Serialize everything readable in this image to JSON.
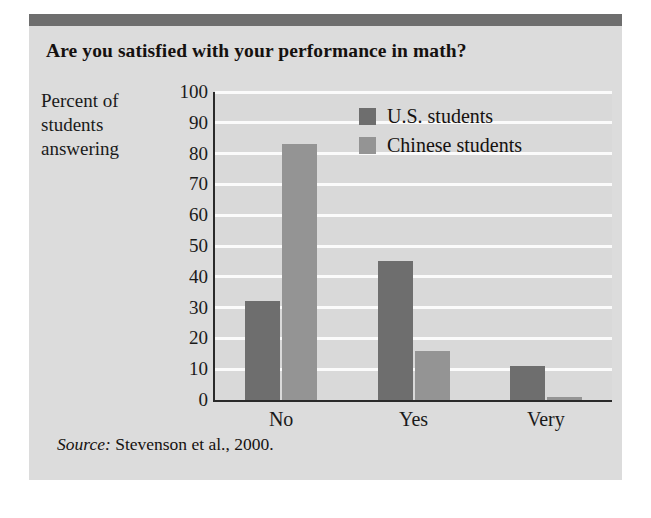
{
  "figure": {
    "title": "Are you satisfied with your performance in math?",
    "axis_caption_lines": [
      "Percent of",
      "students",
      "answering"
    ],
    "source_lead": "Source:",
    "source_text": " Stevenson et al., 2000.",
    "colors": {
      "panel_background": "#dcdcdc",
      "plot_background": "#d9d9d9",
      "top_band": "#6e6e6e",
      "gridline": "#fbfbfb",
      "axis": "#2a2a2a",
      "us_bar": "#6e6e6e",
      "chinese_bar": "#949494",
      "text": "#15110f"
    }
  },
  "chart_data": {
    "type": "bar",
    "title": "Are you satisfied with your performance in math?",
    "xlabel": "",
    "ylabel": "Percent of students answering",
    "categories": [
      "No",
      "Yes",
      "Very"
    ],
    "series": [
      {
        "name": "U.S. students",
        "color": "#6e6e6e",
        "values": [
          32,
          45,
          11
        ]
      },
      {
        "name": "Chinese students",
        "color": "#949494",
        "values": [
          83,
          16,
          1
        ]
      }
    ],
    "ylim": [
      0,
      100
    ],
    "yticks": [
      0,
      10,
      20,
      30,
      40,
      50,
      60,
      70,
      80,
      90,
      100
    ],
    "ytick_labels": [
      "0",
      "10",
      "20",
      "30",
      "40",
      "50",
      "60",
      "70",
      "80",
      "90",
      "100"
    ],
    "grid": true,
    "grid_axis": "y",
    "legend_position": "upper right",
    "annotations": [
      "Source: Stevenson et al., 2000."
    ]
  }
}
